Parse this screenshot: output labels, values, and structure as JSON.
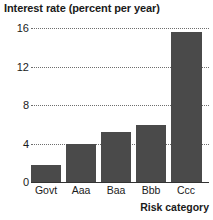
{
  "chart_data": {
    "type": "bar",
    "title": "Interest rate (percent per year)",
    "xlabel": "Risk category",
    "ylabel": "Interest rate (percent per year)",
    "categories": [
      "Govt",
      "Aaa",
      "Baa",
      "Bbb",
      "Ccc"
    ],
    "values": [
      1.9,
      4.0,
      5.3,
      6.0,
      15.6
    ],
    "ylim": [
      0,
      16
    ],
    "yticks": [
      0,
      4,
      8,
      12,
      16
    ],
    "ytick_labels": [
      "0",
      "4",
      "8",
      "12",
      "16"
    ],
    "grid": "horizontal-dotted",
    "legend": null,
    "bar_color": "#4a4a4a",
    "grid_color": "#6e6e6e",
    "axis_color": "#333333",
    "text_color": "#1a1a1a"
  }
}
